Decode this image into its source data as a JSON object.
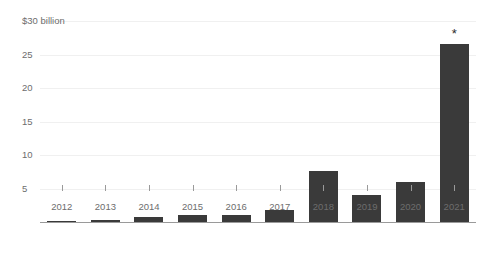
{
  "chart_data": {
    "type": "bar",
    "title": "",
    "subtitle": "",
    "xlabel": "",
    "ylabel": "",
    "units_label": "$30 billion",
    "categories": [
      "2012",
      "2013",
      "2014",
      "2015",
      "2016",
      "2017",
      "2018",
      "2019",
      "2020",
      "2021"
    ],
    "values": [
      0.1,
      0.3,
      0.8,
      1.0,
      1.1,
      1.8,
      7.6,
      4.0,
      6.0,
      26.5
    ],
    "annotations": [
      {
        "category": "2021",
        "symbol": "*"
      }
    ],
    "ylim": [
      0,
      30
    ],
    "yticks": [
      5,
      10,
      15,
      20,
      25,
      30
    ],
    "ytick_labels": [
      "5",
      "10",
      "15",
      "20",
      "25",
      "$30 billion"
    ],
    "grid": true,
    "legend": false,
    "bar_color": "#3a3a3a",
    "axis_color": "#9a9a9a",
    "grid_color": "#f0f0f0",
    "text_color": "#6d6d6d"
  }
}
